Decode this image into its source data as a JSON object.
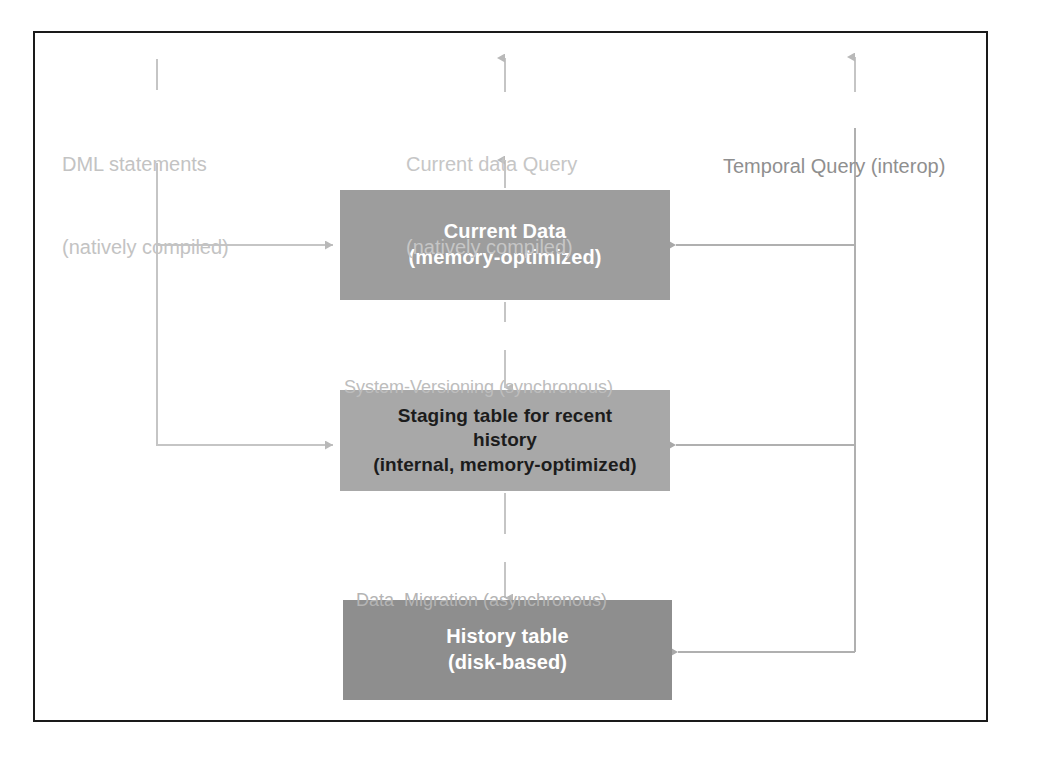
{
  "diagram": {
    "frame": {
      "border_color": "#1a1a1a"
    },
    "nodes": [
      {
        "id": "current",
        "name": "current-data-node",
        "line1": "Current Data",
        "line2": "(memory-optimized)",
        "fill": "#9d9d9d",
        "text_color": "#ffffff"
      },
      {
        "id": "staging",
        "name": "staging-table-node",
        "line1": "Staging table for recent",
        "line2": "history",
        "line3": "(internal, memory-optimized)",
        "fill": "#a8a8a8",
        "text_color": "#1c1c1c"
      },
      {
        "id": "history",
        "name": "history-table-node",
        "line1": "History table",
        "line2": "(disk-based)",
        "fill": "#8e8e8e",
        "text_color": "#ffffff"
      }
    ],
    "labels": {
      "dml": {
        "line1": "DML statements",
        "line2": "(natively compiled)",
        "color": "#c3c3c3"
      },
      "current_query": {
        "line1": "Current data Query",
        "line2": "(natively compiled)",
        "color": "#c6c6c6"
      },
      "temporal_query": {
        "line1": "Temporal Query (interop)",
        "color": "#8f8f8f"
      },
      "system_versioning": {
        "text": "System-Versioning (synchronous)",
        "color": "#bdbdbd"
      },
      "data_migration": {
        "text": "Data  Migration (asynchronous)",
        "color": "#b4b4b4"
      }
    },
    "connectors": [
      {
        "name": "dml-to-current-data",
        "from": "DML statements",
        "to": "Current Data",
        "direction": "right"
      },
      {
        "name": "dml-to-staging-table",
        "from": "DML statements",
        "to": "Staging table for recent history",
        "direction": "right"
      },
      {
        "name": "current-data-to-current-query",
        "from": "Current Data",
        "to": "Current data Query",
        "direction": "up"
      },
      {
        "name": "current-data-to-staging-table",
        "from": "Current Data",
        "to": "Staging table for recent history",
        "direction": "down"
      },
      {
        "name": "staging-table-to-history-table",
        "from": "Staging table for recent history",
        "to": "History table",
        "direction": "down"
      },
      {
        "name": "temporal-query-to-current-data",
        "from": "Temporal Query (interop)",
        "to": "Current Data",
        "direction": "left"
      },
      {
        "name": "temporal-query-to-staging-table",
        "from": "Temporal Query (interop)",
        "to": "Staging table for recent history",
        "direction": "left"
      },
      {
        "name": "temporal-query-to-history-table",
        "from": "Temporal Query (interop)",
        "to": "History table",
        "direction": "left"
      }
    ]
  }
}
